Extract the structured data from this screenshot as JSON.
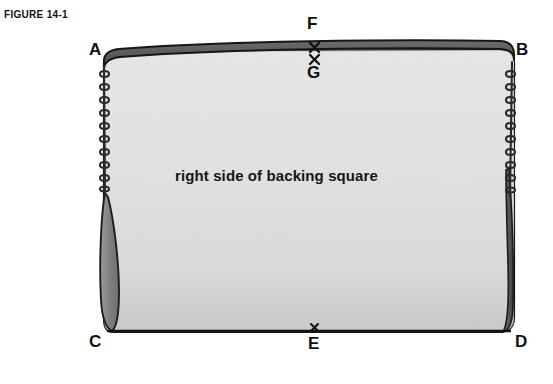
{
  "figure": {
    "label": "FIGURE 14-1",
    "caption": "right side of backing square",
    "type": "sewing-instruction-diagram"
  },
  "labels": {
    "A": "A",
    "B": "B",
    "C": "C",
    "D": "D",
    "E": "E",
    "F": "F",
    "G": "G"
  },
  "marks": {
    "x_upper": "×",
    "x_lower": "×",
    "x_bottom": "×"
  },
  "colors": {
    "page_background": "#ffffff",
    "fabric_fill": "#e2e2e2",
    "fabric_fill_shadow": "#d2d2d2",
    "dark_band": "#5d5d5d",
    "outline": "#1b1b1b",
    "edge_shadow": "#7a7a7a",
    "text": "#111111"
  },
  "annotations": {
    "left_edge": "basting-stitch-line",
    "right_edge": "basting-stitch-line",
    "top_edge": "folded-dark-band",
    "bottom_edge": "straight-seam-line"
  }
}
